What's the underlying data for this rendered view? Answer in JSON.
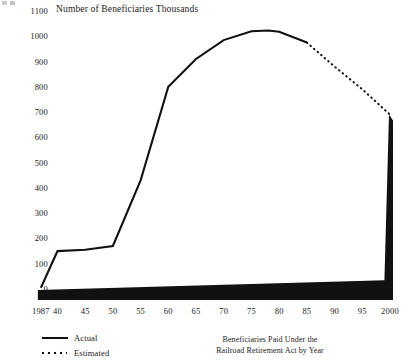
{
  "chart_data": {
    "type": "line",
    "title": "Number of Beneficiaries Thousands",
    "caption_line1": "Beneficiaries Paid Under the",
    "caption_line2": "Railroad Retirement Act by Year",
    "xlabel": "",
    "ylabel": "Number of Beneficiaries Thousands",
    "ylim": [
      0,
      1100
    ],
    "xlim": [
      1937,
      2000
    ],
    "grid": false,
    "legend_position": "bottom-left",
    "yticks": [
      1100,
      1000,
      900,
      800,
      700,
      600,
      500,
      400,
      300,
      200,
      100,
      0
    ],
    "xticks": [
      "1987",
      "40",
      "45",
      "50",
      "55",
      "60",
      "65",
      "70",
      "75",
      "80",
      "85",
      "90",
      "95",
      "2000"
    ],
    "xtick_years": [
      1937,
      1940,
      1945,
      1950,
      1955,
      1960,
      1965,
      1970,
      1975,
      1980,
      1985,
      1990,
      1995,
      2000
    ],
    "line_color": "#111111",
    "fill_color": "#111111",
    "series": [
      {
        "name": "Actual",
        "style": "solid",
        "x": [
          1937,
          1940,
          1945,
          1950,
          1955,
          1960,
          1965,
          1970,
          1975,
          1978,
          1980,
          1985
        ],
        "values": [
          5,
          150,
          155,
          170,
          430,
          800,
          910,
          985,
          1020,
          1023,
          1018,
          975
        ]
      },
      {
        "name": "Estimated",
        "style": "dotted",
        "x": [
          1985,
          1990,
          1995,
          2000
        ],
        "values": [
          975,
          880,
          790,
          690
        ]
      }
    ],
    "legend": [
      {
        "label": "Actual",
        "style": "solid"
      },
      {
        "label": "Estimated",
        "style": "dotted"
      }
    ]
  }
}
